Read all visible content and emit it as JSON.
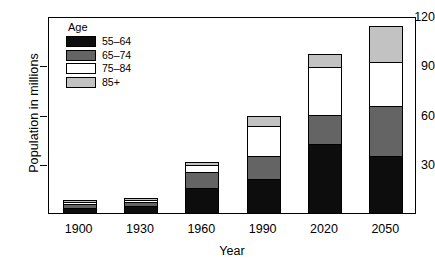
{
  "chart_data": {
    "type": "bar",
    "subtype": "stacked-bar",
    "title": "",
    "xlabel": "Year",
    "ylabel": "Population in millions",
    "categories": [
      "1900",
      "1930",
      "1960",
      "1990",
      "2020",
      "2050"
    ],
    "ylim": [
      0,
      120
    ],
    "yticks": [
      30,
      60,
      90,
      120
    ],
    "ytick_labels": [
      "30",
      "60",
      "90",
      "120"
    ],
    "grid": false,
    "legend_position": "upper-left",
    "legend_title": "Age",
    "series": [
      {
        "name": "55-64",
        "color": "#0d0d0d",
        "values": [
          3,
          4.5,
          15,
          21,
          42,
          35
        ]
      },
      {
        "name": "65-74",
        "color": "#646464",
        "values": [
          2.5,
          2,
          10,
          14,
          18,
          30
        ]
      },
      {
        "name": "75-84",
        "color": "#ffffff",
        "values": [
          1,
          1.5,
          4,
          18,
          29,
          27
        ]
      },
      {
        "name": "85+",
        "color": "#c2c2c2",
        "values": [
          0.5,
          0.5,
          2,
          6,
          8,
          22
        ]
      }
    ],
    "totals": [
      7,
      8.5,
      31,
      59,
      97,
      114
    ]
  },
  "legend": {
    "title": "Age",
    "entries": [
      {
        "label": "55–64",
        "color": "#0d0d0d"
      },
      {
        "label": "65–74",
        "color": "#646464"
      },
      {
        "label": "75–84",
        "color": "#ffffff"
      },
      {
        "label": "85+",
        "color": "#c2c2c2"
      }
    ]
  },
  "axes": {
    "y_label": "Population in millions",
    "x_label": "Year",
    "y_ticks": [
      "120",
      "90",
      "60",
      "30"
    ],
    "x_ticks": [
      "1900",
      "1930",
      "1960",
      "1990",
      "2020",
      "2050"
    ]
  }
}
